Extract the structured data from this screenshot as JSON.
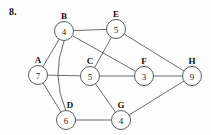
{
  "figure": {
    "number_label": "8.",
    "width": 211,
    "height": 135
  },
  "chart_data": {
    "type": "diagram",
    "title": "8.",
    "nodes": [
      {
        "id": "A",
        "label": "A",
        "value": "7",
        "x": 38,
        "y": 75,
        "r": 9.5,
        "label_dx": 0,
        "label_dy": -12
      },
      {
        "id": "B",
        "label": "B",
        "value": "4",
        "x": 64,
        "y": 31,
        "r": 9.5,
        "label_dx": 0,
        "label_dy": -12
      },
      {
        "id": "C",
        "label": "C",
        "value": "5",
        "x": 90,
        "y": 76,
        "r": 9.5,
        "label_dx": 0,
        "label_dy": -12
      },
      {
        "id": "D",
        "label": "D",
        "value": "6",
        "x": 66,
        "y": 120,
        "r": 9.5,
        "label_dx": 4,
        "label_dy": -12
      },
      {
        "id": "E",
        "label": "E",
        "value": "5",
        "x": 116,
        "y": 29,
        "r": 9.5,
        "label_dx": 0,
        "label_dy": -12
      },
      {
        "id": "F",
        "label": "F",
        "value": "3",
        "x": 144,
        "y": 76,
        "r": 9.5,
        "label_dx": 0,
        "label_dy": -12
      },
      {
        "id": "G",
        "label": "G",
        "value": "4",
        "x": 121,
        "y": 120,
        "r": 9.5,
        "label_dx": 0,
        "label_dy": -12
      },
      {
        "id": "H",
        "label": "H",
        "value": "9",
        "x": 192,
        "y": 76,
        "r": 9.5,
        "label_dx": 0,
        "label_dy": -12
      }
    ],
    "edges": [
      {
        "from": "A",
        "to": "B",
        "curved": false
      },
      {
        "from": "A",
        "to": "C",
        "curved": false
      },
      {
        "from": "A",
        "to": "D",
        "curved": false
      },
      {
        "from": "B",
        "to": "E",
        "curved": false
      },
      {
        "from": "B",
        "to": "F",
        "curved": false
      },
      {
        "from": "B",
        "to": "D",
        "curved": true,
        "bow": 14
      },
      {
        "from": "E",
        "to": "C",
        "curved": false
      },
      {
        "from": "E",
        "to": "H",
        "curved": false
      },
      {
        "from": "C",
        "to": "F",
        "curved": false
      },
      {
        "from": "C",
        "to": "G",
        "curved": false
      },
      {
        "from": "F",
        "to": "H",
        "curved": false
      },
      {
        "from": "D",
        "to": "G",
        "curved": false
      },
      {
        "from": "G",
        "to": "H",
        "curved": false
      }
    ],
    "node_count": 8,
    "edge_count": 13
  }
}
